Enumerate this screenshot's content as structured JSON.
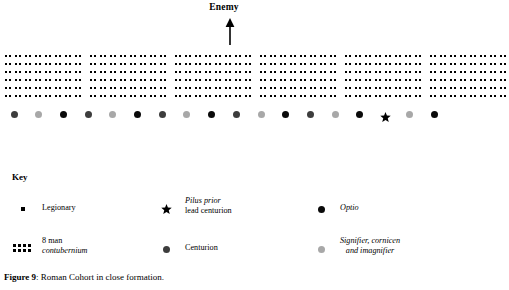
{
  "figure": {
    "caption_label": "Figure 9",
    "caption_sep": ": ",
    "caption_text": "Roman Cohort in close formation."
  },
  "direction": {
    "enemy_label": "Enemy",
    "arrow_icon": "arrow-up-icon"
  },
  "colors": {
    "ink": "#000000",
    "optio": "#0a0a0a",
    "centurion": "#3d3d3d",
    "signifer": "#a8a8a8",
    "background": "#ffffff"
  },
  "formation": {
    "rows": 6,
    "contubernium_columns": 2,
    "contubernium_rows": 6,
    "contubernia_per_century": 8,
    "centuries": 6,
    "group_pattern": [
      8,
      8,
      8,
      8,
      8,
      8
    ],
    "description": "Roman cohort of six centuries in close order, each century eight contubernia wide and six ranks deep"
  },
  "markers": {
    "sequence": [
      {
        "type": "centurion",
        "icon": "filled-circle-icon"
      },
      {
        "type": "signifer",
        "icon": "filled-circle-icon"
      },
      {
        "type": "optio",
        "icon": "filled-circle-icon"
      },
      {
        "type": "centurion",
        "icon": "filled-circle-icon"
      },
      {
        "type": "signifer",
        "icon": "filled-circle-icon"
      },
      {
        "type": "optio",
        "icon": "filled-circle-icon"
      },
      {
        "type": "centurion",
        "icon": "filled-circle-icon"
      },
      {
        "type": "signifer",
        "icon": "filled-circle-icon"
      },
      {
        "type": "optio",
        "icon": "filled-circle-icon"
      },
      {
        "type": "centurion",
        "icon": "filled-circle-icon"
      },
      {
        "type": "signifer",
        "icon": "filled-circle-icon"
      },
      {
        "type": "optio",
        "icon": "filled-circle-icon"
      },
      {
        "type": "centurion",
        "icon": "filled-circle-icon"
      },
      {
        "type": "signifer",
        "icon": "filled-circle-icon"
      },
      {
        "type": "optio",
        "icon": "filled-circle-icon"
      },
      {
        "type": "pilus_prior",
        "icon": "star-icon"
      },
      {
        "type": "signifer",
        "icon": "filled-circle-icon"
      },
      {
        "type": "optio",
        "icon": "filled-circle-icon"
      }
    ]
  },
  "key": {
    "title": "Key",
    "entries": [
      {
        "icon": "small-square-icon",
        "label_lines": [
          {
            "text": "Legionary",
            "italic": false
          }
        ]
      },
      {
        "icon": "star-icon",
        "label_lines": [
          {
            "text": "Pilus prior",
            "italic": true
          },
          {
            "text": "lead centurion",
            "italic": false
          }
        ]
      },
      {
        "icon": "filled-circle-icon",
        "label_lines": [
          {
            "text": "Optio",
            "italic": true
          }
        ]
      },
      {
        "icon": "contubernium-grid-icon",
        "label_lines": [
          {
            "text": "8 man",
            "italic": false
          },
          {
            "text": "contubernium",
            "italic": true
          }
        ]
      },
      {
        "icon": "filled-circle-icon",
        "label_lines": [
          {
            "text": "Centurion",
            "italic": false
          }
        ]
      },
      {
        "icon": "filled-circle-icon",
        "label_lines": [
          {
            "text": "Signifier, cornicen",
            "italic": true
          },
          {
            "text": "and imagnifier",
            "italic": true
          }
        ]
      }
    ]
  }
}
